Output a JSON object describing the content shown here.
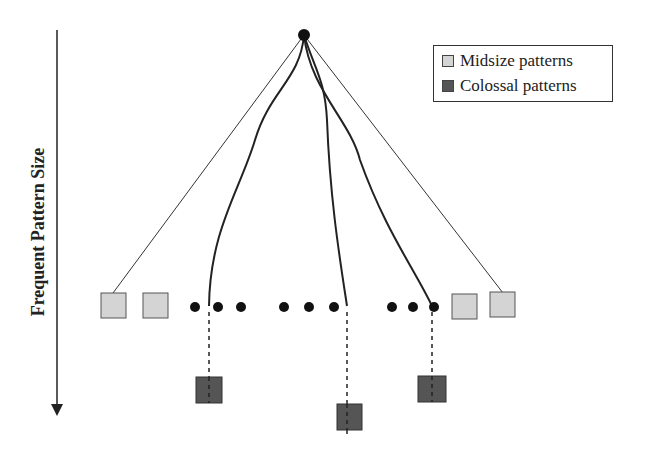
{
  "axis": {
    "label": "Frequent Pattern Size",
    "direction": "down"
  },
  "legend": {
    "items": [
      {
        "label": "Midsize patterns",
        "color": "#d4d4d4"
      },
      {
        "label": "Colossal patterns",
        "color": "#555555"
      }
    ]
  },
  "colors": {
    "midsize": "#d4d4d4",
    "colossal": "#555555",
    "line": "#222222"
  }
}
